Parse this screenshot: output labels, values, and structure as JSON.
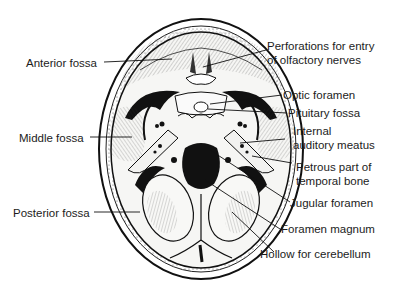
{
  "diagram": {
    "colors": {
      "ink": "#1a1a1a",
      "background": "#ffffff",
      "bone_fill": "#f4f4f2",
      "foramen_fill": "#111111"
    },
    "labels_left": [
      {
        "id": "anterior-fossa",
        "text": "Anterior fossa"
      },
      {
        "id": "middle-fossa",
        "text": "Middle fossa"
      },
      {
        "id": "posterior-fossa",
        "text": "Posterior fossa"
      }
    ],
    "labels_right": [
      {
        "id": "perforations",
        "line1": "Perforations for entry",
        "line2": "of olfactory nerves"
      },
      {
        "id": "optic-foramen",
        "text": "Optic foramen"
      },
      {
        "id": "pituitary-fossa",
        "text": "Pituitary fossa"
      },
      {
        "id": "internal-auditory-meatus",
        "line1": "Internal",
        "line2": "auditory meatus"
      },
      {
        "id": "petrous-part",
        "line1": "Petrous part of",
        "line2": "temporal bone"
      },
      {
        "id": "jugular-foramen",
        "text": "Jugular foramen"
      },
      {
        "id": "foramen-magnum",
        "text": "Foramen magnum"
      },
      {
        "id": "hollow-cerebellum",
        "text": "Hollow for cerebellum"
      }
    ]
  }
}
